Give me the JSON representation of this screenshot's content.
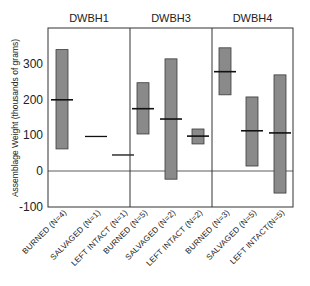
{
  "chart_data": {
    "type": "bar",
    "subtype": "floating-range-with-mean",
    "title": "",
    "xlabel": "",
    "ylabel": "Assemblage Weight (thousands of grams)",
    "ylim": [
      -100,
      385
    ],
    "yticks": [
      -100,
      0,
      100,
      200,
      300
    ],
    "grid": false,
    "zero_line": true,
    "legend": null,
    "panels": [
      {
        "title": "DWBH1",
        "categories": [
          {
            "label": "BURNED (N=4)",
            "min": 62,
            "max": 341,
            "mean": 200,
            "type": "range"
          },
          {
            "label": "SALVAGED (N=1)",
            "min": null,
            "max": null,
            "mean": 97,
            "type": "single"
          },
          {
            "label": "LEFT INTACT (N=1)",
            "min": null,
            "max": null,
            "mean": 45,
            "type": "single"
          }
        ]
      },
      {
        "title": "DWBH3",
        "categories": [
          {
            "label": "BURNED (N=5)",
            "min": 104,
            "max": 248,
            "mean": 175,
            "type": "range"
          },
          {
            "label": "SALVAGED (N=2)",
            "min": -23,
            "max": 315,
            "mean": 146,
            "type": "range"
          },
          {
            "label": "LEFT INTACT (N=2)",
            "min": 76,
            "max": 118,
            "mean": 98,
            "type": "range"
          }
        ]
      },
      {
        "title": "DWBH4",
        "categories": [
          {
            "label": "BURNED (N=3)",
            "min": 214,
            "max": 346,
            "mean": 279,
            "type": "range"
          },
          {
            "label": "SALVAGED (N=5)",
            "min": 14,
            "max": 208,
            "mean": 113,
            "type": "range"
          },
          {
            "label": "LEFT INTACT(N=5)",
            "min": -62,
            "max": 270,
            "mean": 107,
            "type": "range"
          }
        ]
      }
    ]
  },
  "colors": {
    "bar_fill": "#8a8a8a",
    "bar_stroke": "#3a3a3a",
    "axis": "#333333",
    "mean_mark": "#111111"
  }
}
